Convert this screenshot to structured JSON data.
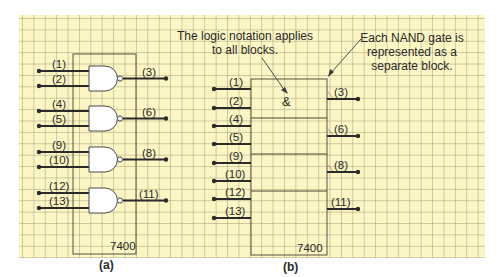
{
  "figure_a": {
    "caption": "(a)",
    "chip_label": "7400",
    "gates": [
      {
        "inputs": [
          "(1)",
          "(2)"
        ],
        "output": "(3)"
      },
      {
        "inputs": [
          "(4)",
          "(5)"
        ],
        "output": "(6)"
      },
      {
        "inputs": [
          "(9)",
          "(10)"
        ],
        "output": "(8)"
      },
      {
        "inputs": [
          "(12)",
          "(13)"
        ],
        "output": "(11)"
      }
    ]
  },
  "figure_b": {
    "caption": "(b)",
    "chip_label": "7400",
    "symbol": "&",
    "inputs": [
      "(1)",
      "(2)",
      "(4)",
      "(5)",
      "(9)",
      "(10)",
      "(12)",
      "(13)"
    ],
    "outputs": [
      "(3)",
      "(6)",
      "(8)",
      "(11)"
    ],
    "annotation_left": [
      "The logic notation applies",
      "to all blocks."
    ],
    "annotation_right": [
      "Each NAND gate is",
      "represented as a",
      "separate block."
    ]
  },
  "colors": {
    "background": "#fcf6c4",
    "grid": "#a59b7a",
    "line": "#2a2a2a",
    "gate_fill": "#ffffff"
  }
}
